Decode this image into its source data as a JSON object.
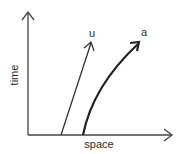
{
  "diagram": {
    "type": "spacetime",
    "axes": {
      "x_label": "space",
      "y_label": "time"
    },
    "worldlines": [
      {
        "id": "u",
        "label": "u",
        "shape": "straight",
        "description": "constant velocity"
      },
      {
        "id": "a",
        "label": "a",
        "shape": "curved",
        "description": "accelerating"
      }
    ],
    "colors": {
      "stroke": "#333333",
      "background": "#ffffff"
    }
  }
}
